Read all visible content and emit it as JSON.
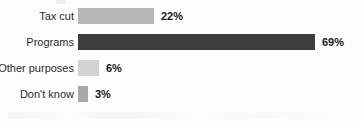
{
  "chart_data": {
    "type": "bar",
    "orientation": "horizontal",
    "title": "",
    "subtitle": "",
    "xlabel": "",
    "ylabel": "",
    "xlim": [
      0,
      100
    ],
    "grid": false,
    "legend": false,
    "value_suffix": "%",
    "categories": [
      "Tax cut",
      "Programs",
      "Other purposes",
      "Don't know"
    ],
    "values": [
      22,
      69,
      6,
      3
    ],
    "value_labels": [
      "22%",
      "69%",
      "6%",
      "3%"
    ],
    "bar_colors": [
      "#b5b5b5",
      "#3d3d3d",
      "#d2d2d2",
      "#a8a8a8"
    ],
    "bars": [
      {
        "category": "Tax cut",
        "value": 22,
        "value_label": "22%",
        "color": "#b5b5b5"
      },
      {
        "category": "Programs",
        "value": 69,
        "value_label": "69%",
        "color": "#3d3d3d"
      },
      {
        "category": "Other purposes",
        "value": 6,
        "value_label": "6%",
        "color": "#d2d2d2"
      },
      {
        "category": "Don't know",
        "value": 3,
        "value_label": "3%",
        "color": "#a8a8a8"
      }
    ]
  },
  "style": {
    "background": "#fdfdfd",
    "label_color": "#2b2b2b",
    "value_color": "#171717"
  }
}
